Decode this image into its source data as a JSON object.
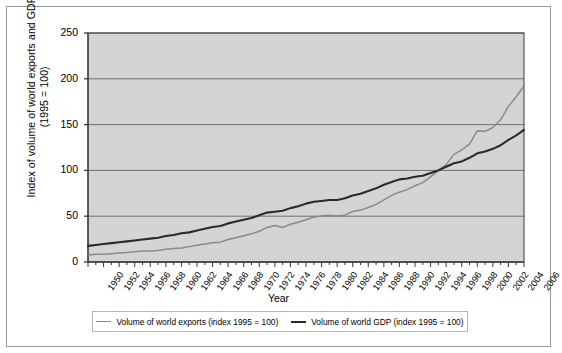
{
  "chart_data": {
    "type": "line",
    "title": "",
    "xlabel": "Year",
    "ylabel": "Index of volume of world exports and GDP (1995 = 100)",
    "ylim": [
      0,
      250
    ],
    "yticks": [
      0,
      50,
      100,
      150,
      200,
      250
    ],
    "xlim": [
      1950,
      2006
    ],
    "grid": true,
    "legend_position": "bottom",
    "xticks": [
      1950,
      1952,
      1954,
      1956,
      1958,
      1960,
      1962,
      1964,
      1966,
      1968,
      1970,
      1972,
      1974,
      1976,
      1978,
      1980,
      1982,
      1984,
      1986,
      1988,
      1990,
      1992,
      1994,
      1996,
      1998,
      2000,
      2002,
      2004,
      2006
    ],
    "x": [
      1950,
      1951,
      1952,
      1953,
      1954,
      1955,
      1956,
      1957,
      1958,
      1959,
      1960,
      1961,
      1962,
      1963,
      1964,
      1965,
      1966,
      1967,
      1968,
      1969,
      1970,
      1971,
      1972,
      1973,
      1974,
      1975,
      1976,
      1977,
      1978,
      1979,
      1980,
      1981,
      1982,
      1983,
      1984,
      1985,
      1986,
      1987,
      1988,
      1989,
      1990,
      1991,
      1992,
      1993,
      1994,
      1995,
      1996,
      1997,
      1998,
      1999,
      2000,
      2001,
      2002,
      2003,
      2004,
      2005,
      2006
    ],
    "series": [
      {
        "name": "Volume of world exports (index 1995 = 100)",
        "color": "#8a8a8a",
        "values": [
          11,
          12,
          12,
          13,
          14,
          15,
          16,
          17,
          17,
          18,
          20,
          21,
          22,
          24,
          26,
          28,
          30,
          31,
          35,
          38,
          41,
          44,
          48,
          54,
          57,
          54,
          59,
          62,
          66,
          70,
          72,
          73,
          72,
          73,
          79,
          81,
          85,
          90,
          97,
          104,
          109,
          113,
          119,
          124,
          133,
          143,
          152,
          168,
          175,
          184,
          205,
          204,
          210,
          222,
          243,
          258,
          275
        ]
      },
      {
        "name": "Volume of world GDP (index 1995 = 100)",
        "color": "#2a2a2a",
        "values": [
          18,
          19,
          20,
          21,
          22,
          23,
          24,
          25,
          26,
          27,
          29,
          30,
          32,
          33,
          35,
          37,
          39,
          40,
          43,
          45,
          47,
          49,
          52,
          55,
          56,
          57,
          60,
          62,
          65,
          67,
          68,
          69,
          69,
          71,
          74,
          76,
          79,
          82,
          86,
          89,
          92,
          93,
          95,
          96,
          99,
          102,
          106,
          110,
          112,
          116,
          121,
          123,
          126,
          130,
          136,
          141,
          147
        ]
      }
    ]
  },
  "legend": {
    "entries": [
      {
        "label": "Volume of world exports (index 1995 = 100)",
        "color": "#8a8a8a"
      },
      {
        "label": "Volume of world GDP (index 1995 = 100)",
        "color": "#2a2a2a"
      }
    ]
  },
  "colors": {
    "plot_background": "#d4d4d4",
    "grid_line": "#6f6f6f",
    "axis_line": "#3a3a3a",
    "frame": "#9a9a9a",
    "exports_line": "#8a8a8a",
    "gdp_line": "#2a2a2a"
  }
}
